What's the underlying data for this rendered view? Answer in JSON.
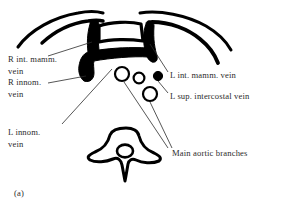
{
  "figure": {
    "caption": "(a)",
    "type": "anatomical-cross-section-line-drawing",
    "region": "upper thorax axial section",
    "ink_color": "#000000",
    "text_color": "#2b2b2b",
    "background_color": "#ffffff"
  },
  "labels": {
    "r_int_mamm_vein": "R int. mamm.\nvein",
    "r_innom_vein": "R innom.\nvein",
    "l_innom_vein": "L innom.\nvein",
    "l_int_mamm_vein": "L int. mamm. vein",
    "l_sup_intercostal_vein": "L sup. intercostal vein",
    "main_aortic_branches": "Main aortic branches"
  },
  "structures": [
    {
      "name": "right-rib-arc-outer",
      "kind": "rib-outline"
    },
    {
      "name": "right-rib-arc-inner",
      "kind": "rib-outline"
    },
    {
      "name": "left-rib-arc-outer",
      "kind": "rib-outline"
    },
    {
      "name": "left-rib-arc-inner",
      "kind": "rib-outline"
    },
    {
      "name": "sternum-manubrium",
      "kind": "bone-outline"
    },
    {
      "name": "innominate-vein-mass",
      "kind": "filled-vein"
    },
    {
      "name": "right-internal-mammary-vein",
      "kind": "filled-vein"
    },
    {
      "name": "left-internal-mammary-vein",
      "kind": "filled-dot"
    },
    {
      "name": "aortic-branch-vessel-1",
      "kind": "open-circle"
    },
    {
      "name": "aortic-branch-vessel-2",
      "kind": "open-circle"
    },
    {
      "name": "aortic-branch-vessel-3",
      "kind": "open-circle"
    },
    {
      "name": "vertebral-body",
      "kind": "bone-outline"
    },
    {
      "name": "spinal-canal",
      "kind": "open-circle"
    }
  ]
}
